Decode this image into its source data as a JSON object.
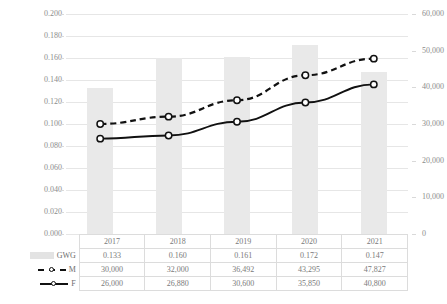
{
  "chart_data": {
    "type": "bar",
    "title": "",
    "xlabel": "",
    "ylabel": "",
    "grid": true,
    "legend_position": "bottom-table",
    "categories": [
      "2017",
      "2018",
      "2019",
      "2020",
      "2021"
    ],
    "axes": {
      "left": {
        "ticks": [
          "0.000",
          "0.020",
          "0.040",
          "0.060",
          "0.080",
          "0.100",
          "0.120",
          "0.140",
          "0.160",
          "0.180",
          "0.200"
        ],
        "values": [
          0,
          0.02,
          0.04,
          0.06,
          0.08,
          0.1,
          0.12,
          0.14,
          0.16,
          0.18,
          0.2
        ],
        "ylim": [
          0,
          0.2
        ]
      },
      "right": {
        "ticks": [
          "0",
          "10,000",
          "20,000",
          "30,000",
          "40,000",
          "50,000",
          "60,000"
        ],
        "values": [
          0,
          10000,
          20000,
          30000,
          40000,
          50000,
          60000
        ],
        "ylim": [
          0,
          60000
        ]
      }
    },
    "series": [
      {
        "name": "GWG",
        "type": "bar",
        "axis": "left",
        "color": "#e9e9e9",
        "values": [
          0.133,
          0.16,
          0.161,
          0.172,
          0.147
        ],
        "labels": [
          "0.133",
          "0.160",
          "0.161",
          "0.172",
          "0.147"
        ]
      },
      {
        "name": "M",
        "type": "line",
        "axis": "right",
        "style": "dashed",
        "color": "#111111",
        "marker": "circle",
        "values": [
          30000,
          32000,
          36492,
          43295,
          47827
        ],
        "labels": [
          "30,000",
          "32,000",
          "36,492",
          "43,295",
          "47,827"
        ]
      },
      {
        "name": "F",
        "type": "line",
        "axis": "right",
        "style": "solid",
        "color": "#111111",
        "marker": "circle",
        "values": [
          26000,
          26880,
          30600,
          35850,
          40800
        ],
        "labels": [
          "26,000",
          "26,880",
          "30,600",
          "35,850",
          "40,800"
        ]
      }
    ]
  },
  "table": {
    "header_label": "",
    "columns": [
      "2017",
      "2018",
      "2019",
      "2020",
      "2021"
    ],
    "rows": [
      {
        "label": "GWG",
        "legend": "bar-swatch",
        "cells": [
          "0.133",
          "0.160",
          "0.161",
          "0.172",
          "0.147"
        ]
      },
      {
        "label": "M",
        "legend": "dashed-line-marker",
        "cells": [
          "30,000",
          "32,000",
          "36,492",
          "43,295",
          "47,827"
        ]
      },
      {
        "label": "F",
        "legend": "solid-line-marker",
        "cells": [
          "26,000",
          "26,880",
          "30,600",
          "35,850",
          "40,800"
        ]
      }
    ]
  }
}
